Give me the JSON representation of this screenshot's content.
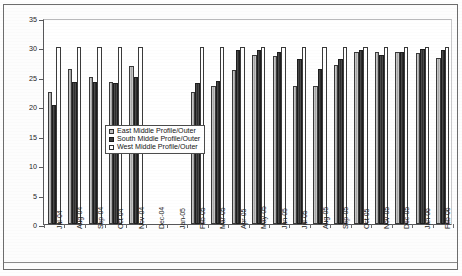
{
  "chart_data": {
    "type": "bar",
    "title": "",
    "xlabel": "",
    "ylabel": "Dowel Moisture Content [%]",
    "ylim": [
      0,
      35
    ],
    "ytick_step": 5,
    "yticks": [
      0,
      5,
      10,
      15,
      20,
      25,
      30,
      35
    ],
    "grid": false,
    "legend_position": "center-left-inside",
    "categories": [
      "Jul-04",
      "Aug-04",
      "Sep-04",
      "Oct-04",
      "Nov-04",
      "Dec-04",
      "Jan-05",
      "Feb-05",
      "Mar-05",
      "Apr-05",
      "May-05",
      "Jun-05",
      "Jul-05",
      "Aug-05",
      "Sep-05",
      "Oct-05",
      "Nov-05",
      "Dec-05",
      "Jan-06",
      "Feb-06"
    ],
    "series": [
      {
        "name": "East Middle Profile/Outer",
        "color": "#b4b4b4",
        "values": [
          22.4,
          26.3,
          25.0,
          24.1,
          26.8,
          null,
          null,
          22.5,
          23.5,
          26.2,
          28.8,
          28.5,
          23.5,
          23.5,
          27.0,
          29.3,
          29.2,
          29.2,
          29.0,
          28.2
        ]
      },
      {
        "name": "South Middle Profile/Outer",
        "color": "#3d3d3d",
        "values": [
          20.3,
          24.2,
          24.2,
          24.0,
          25.0,
          null,
          null,
          24.0,
          24.3,
          29.5,
          29.6,
          29.3,
          28.0,
          26.3,
          28.0,
          29.5,
          28.8,
          29.3,
          29.8,
          29.5
        ]
      },
      {
        "name": "West Middle Profile/Outer",
        "color": "#ffffff",
        "values": [
          30.0,
          30.0,
          30.0,
          30.0,
          30.0,
          null,
          null,
          30.0,
          30.0,
          30.0,
          30.0,
          30.0,
          30.0,
          30.0,
          30.0,
          30.0,
          30.0,
          30.0,
          30.0,
          30.0
        ]
      }
    ],
    "missing_categories": [
      "Dec-04",
      "Jan-05"
    ]
  },
  "legend": {
    "entries": [
      {
        "label": "East Middle Profile/Outer",
        "swatch": "east"
      },
      {
        "label": "South Middle Profile/Outer",
        "swatch": "south"
      },
      {
        "label": "West Middle Profile/Outer",
        "swatch": "west"
      }
    ]
  }
}
